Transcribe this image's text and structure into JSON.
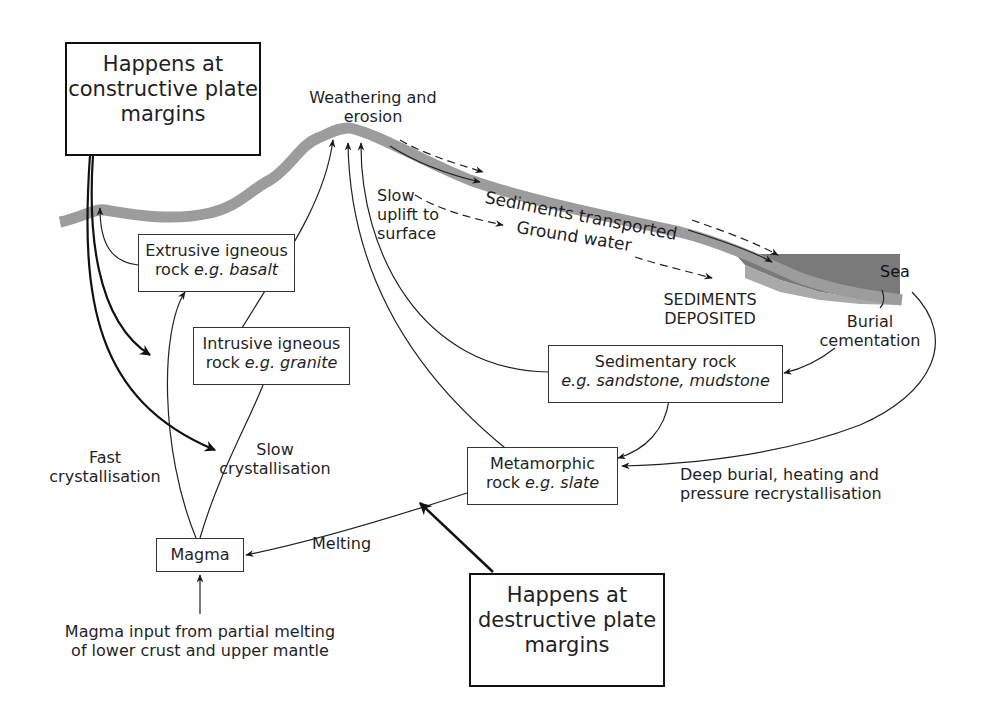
{
  "diagram": {
    "colors": {
      "ground_line": "#9c9c9c",
      "sea": "#7a7a7a",
      "sea_floor": "#a9a9a9",
      "arrow": "#1a1a1a"
    },
    "plate_boxes": {
      "constructive": {
        "line1": "Happens at",
        "line2": "constructive plate",
        "line3": "margins"
      },
      "destructive": {
        "line1": "Happens at",
        "line2": "destructive plate",
        "line3": "margins"
      }
    },
    "rock_boxes": {
      "extrusive": {
        "line1": "Extrusive igneous",
        "line2_prefix": "rock ",
        "line2_italic": "e.g. basalt"
      },
      "intrusive": {
        "line1": "Intrusive igneous",
        "line2_prefix": "rock ",
        "line2_italic": "e.g. granite"
      },
      "sedimentary": {
        "line1": "Sedimentary rock",
        "line2_italic": "e.g. sandstone, mudstone"
      },
      "metamorphic": {
        "line1": "Metamorphic",
        "line2_prefix": "rock ",
        "line2_italic": "e.g. slate"
      },
      "magma": {
        "label": "Magma"
      }
    },
    "process_labels": {
      "weathering": {
        "line1": "Weathering and",
        "line2": "erosion"
      },
      "sediments_transported": "Sediments transported",
      "ground_water": "Ground water",
      "slow_uplift": {
        "line1": "Slow",
        "line2": "uplift to",
        "line3": "surface"
      },
      "sediments_deposited": {
        "line1": "SEDIMENTS",
        "line2": "DEPOSITED"
      },
      "burial": {
        "line1": "Burial",
        "line2": "cementation"
      },
      "sea": "Sea",
      "fast_crystallisation": {
        "line1": "Fast",
        "line2": "crystallisation"
      },
      "slow_crystallisation": {
        "line1": "Slow",
        "line2": "crystallisation"
      },
      "melting": "Melting",
      "deep_burial": {
        "line1": "Deep burial, heating and",
        "line2": "pressure recrystallisation"
      },
      "magma_input": {
        "line1": "Magma input from partial melting",
        "line2": "of lower crust and upper mantle"
      }
    }
  }
}
